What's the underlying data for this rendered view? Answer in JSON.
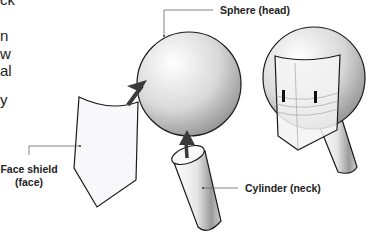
{
  "left_text_fragments": [
    "ck",
    "n",
    "w",
    "al",
    "y"
  ],
  "labels": {
    "sphere": "Sphere (head)",
    "face_shield_line1": "Face shield",
    "face_shield_line2": "(face)",
    "cylinder": "Cylinder (neck)"
  },
  "colors": {
    "outline": "#1a1a1a",
    "arrow": "#3a3a3a",
    "leader": "#666666",
    "eye": "#111111"
  }
}
